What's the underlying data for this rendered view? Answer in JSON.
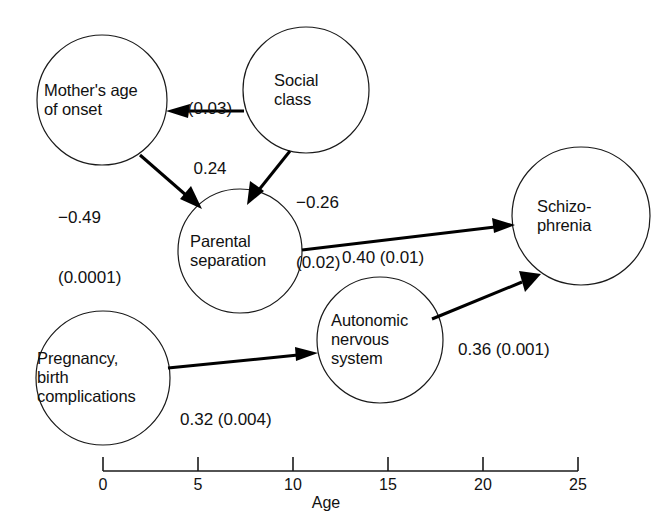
{
  "diagram": {
    "type": "path-diagram",
    "nodes": [
      {
        "id": "mothers-age-of-onset",
        "label": "Mother's age\nof onset",
        "cx": 102,
        "cy": 100,
        "r": 65
      },
      {
        "id": "social-class",
        "label": "Social\nclass",
        "cx": 306,
        "cy": 90,
        "r": 63
      },
      {
        "id": "parental-separation",
        "label": "Parental\nseparation",
        "cx": 240,
        "cy": 251,
        "r": 62
      },
      {
        "id": "schizophrenia",
        "label": "Schizo-\nphrenia",
        "cx": 581,
        "cy": 216,
        "r": 69
      },
      {
        "id": "autonomic-nervous-system",
        "label": "Autonomic\nnervous\nsystem",
        "cx": 380,
        "cy": 340,
        "r": 63
      },
      {
        "id": "pregnancy-birth-complications",
        "label": "Pregnancy,\nbirth\ncomplications",
        "cx": 103,
        "cy": 378,
        "r": 67
      }
    ],
    "edges": [
      {
        "id": "social-class-to-mothers-age",
        "from": "social-class",
        "to": "mothers-age-of-onset",
        "coefficient": "0.24",
        "p_value": "(0.03)",
        "label_lines": [
          "(0.03)",
          "0.24"
        ]
      },
      {
        "id": "mothers-age-to-parental-separation",
        "from": "mothers-age-of-onset",
        "to": "parental-separation",
        "coefficient": "−0.49",
        "p_value": "(0.0001)",
        "label_lines": [
          "−0.49",
          "(0.0001)"
        ]
      },
      {
        "id": "social-class-to-parental-separation",
        "from": "social-class",
        "to": "parental-separation",
        "coefficient": "−0.26",
        "p_value": "(0.02)",
        "label_lines": [
          "−0.26",
          "(0.02)"
        ]
      },
      {
        "id": "parental-separation-to-schizophrenia",
        "from": "parental-separation",
        "to": "schizophrenia",
        "coefficient": "0.40",
        "p_value": "(0.01)",
        "label_lines": [
          "0.40 (0.01)"
        ]
      },
      {
        "id": "pregnancy-to-autonomic-nervous-system",
        "from": "pregnancy-birth-complications",
        "to": "autonomic-nervous-system",
        "coefficient": "0.32",
        "p_value": "(0.004)",
        "label_lines": [
          "0.32 (0.004)"
        ]
      },
      {
        "id": "autonomic-nervous-system-to-schizophrenia",
        "from": "autonomic-nervous-system",
        "to": "schizophrenia",
        "coefficient": "0.36",
        "p_value": "(0.001)",
        "label_lines": [
          "0.36 (0.001)"
        ]
      }
    ]
  },
  "axis": {
    "title": "Age",
    "ticks": [
      "0",
      "5",
      "10",
      "15",
      "20",
      "25"
    ],
    "range": [
      0,
      25
    ],
    "step": 5
  },
  "colors": {
    "stroke": "#1a1a1a",
    "arrow": "#000000",
    "background": "#ffffff"
  }
}
